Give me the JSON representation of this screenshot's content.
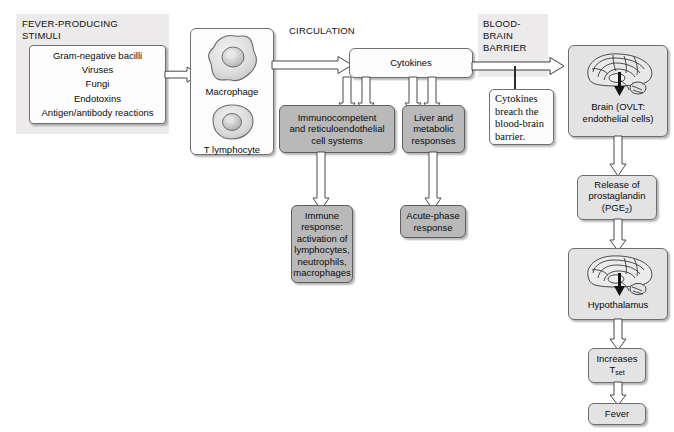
{
  "diagram": {
    "sections": {
      "stimuli_heading": "FEVER-PRODUCING\nSTIMULI",
      "circulation_heading": "CIRCULATION",
      "bbb_heading": "BLOOD-\nBRAIN\nBARRIER"
    },
    "stimuli_box": {
      "items": "Gram-negative bacilli\nViruses\nFungi\nEndotoxins\nAntigen/antibody reactions"
    },
    "cells": {
      "macrophage_label": "Macrophage",
      "lymphocyte_label": "T lymphocyte",
      "macrophage_icon": "macrophage-cell-icon",
      "lymphocyte_icon": "t-lymphocyte-cell-icon"
    },
    "nodes": {
      "cytokines": "Cytokines",
      "immunocompetent": "Immunocompetent\nand reticuloendothelial\ncell systems",
      "liver": "Liver and\nmetabolic\nresponses",
      "immune_response": "Immune\nresponse:\nactivation of\nlymphocytes,\nneutrophils,\nmacrophages",
      "acute_phase": "Acute-phase\nresponse",
      "brain": "Brain (OVLT:\nendothelial cells)",
      "prostaglandin_line1": "Release of",
      "prostaglandin_line2": "prostaglandin",
      "prostaglandin_line3": "(PGE",
      "prostaglandin_sub": "2",
      "prostaglandin_line3_end": ")",
      "hypothalamus": "Hypothalamus",
      "increases_line1": "Increases",
      "increases_line2": "T",
      "increases_sub": "set",
      "fever": "Fever"
    },
    "callout": {
      "text": "Cytokines\nbreach the\nblood-brain\nbarrier."
    },
    "icons": {
      "brain_top": "brain-sagittal-icon",
      "brain_bottom": "brain-sagittal-hypothalamus-icon",
      "arrow": "block-arrow-icon"
    },
    "colors": {
      "panel_tint": "#eceaea",
      "box_grey": "#b9b9b9",
      "box_light": "#e3e3e3",
      "box_white": "#fdfdfd",
      "stroke": "#6f6f6f",
      "text": "#0b0b0b"
    }
  }
}
